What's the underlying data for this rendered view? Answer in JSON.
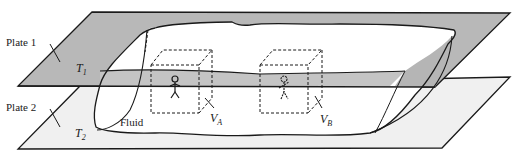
{
  "diagram": {
    "plates": [
      {
        "label": "Plate 1",
        "temperature_symbol": "T",
        "temperature_subscript": "1",
        "color": "#b8b8b8"
      },
      {
        "label": "Plate 2",
        "temperature_symbol": "T",
        "temperature_subscript": "2",
        "color": "#f2f2f2"
      }
    ],
    "fluid_label": "Fluid",
    "volumes": [
      {
        "symbol": "V",
        "subscript": "A"
      },
      {
        "symbol": "V",
        "subscript": "B"
      }
    ],
    "colors": {
      "line": "#1a1a1a",
      "plate_top": "#b5b5b5",
      "plate_bottom": "#f0f0f0",
      "fluid_band": "#c4c4c4"
    }
  }
}
